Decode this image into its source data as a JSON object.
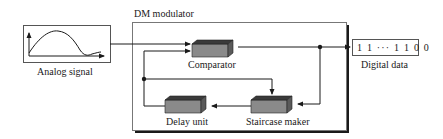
{
  "diagram": {
    "title": "DM modulator",
    "input": {
      "label": "Analog signal",
      "icon": "analog-waveform-plot"
    },
    "blocks": [
      {
        "id": "comparator",
        "label": "Comparator"
      },
      {
        "id": "staircase",
        "label": "Staircase maker"
      },
      {
        "id": "delay",
        "label": "Delay unit"
      }
    ],
    "output": {
      "value": "1 1 ··· 1 1 0 0",
      "label": "Digital data"
    },
    "connections": [
      {
        "from": "Analog signal",
        "to": "Comparator"
      },
      {
        "from": "Comparator",
        "to": "Digital data"
      },
      {
        "from": "Comparator",
        "to": "Staircase maker"
      },
      {
        "from": "Staircase maker",
        "to": "Delay unit"
      },
      {
        "from": "Delay unit",
        "to": "Comparator"
      },
      {
        "from": "Delay unit",
        "to": "Staircase maker"
      }
    ],
    "colors": {
      "line": "#1a1a1a",
      "block_front": "#8a8a8a",
      "block_top": "#3a3a3a",
      "block_side": "#5a5a5a",
      "box_border": "#666666"
    }
  }
}
